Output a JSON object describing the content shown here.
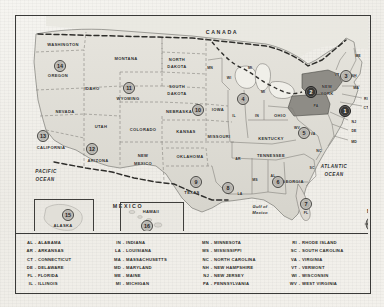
{
  "map": {
    "title": "United States numbered region map",
    "countries": [
      {
        "name": "CANADA",
        "x": 206,
        "y": 16,
        "cls": "big"
      },
      {
        "name": "MEXICO",
        "x": 112,
        "y": 190,
        "cls": "big"
      }
    ],
    "oceans": [
      {
        "name": "PACIFIC",
        "x": 30,
        "y": 155,
        "cls": "ocean"
      },
      {
        "name": "OCEAN",
        "x": 29,
        "y": 163,
        "cls": "ocean"
      },
      {
        "name": "ATLANTIC",
        "x": 318,
        "y": 150,
        "cls": "ocean"
      },
      {
        "name": "OCEAN",
        "x": 318,
        "y": 158,
        "cls": "ocean"
      },
      {
        "name": "Gulf of",
        "x": 244,
        "y": 190,
        "cls": "gulf"
      },
      {
        "name": "Mexico",
        "x": 244,
        "y": 196,
        "cls": "gulf"
      }
    ],
    "states": [
      {
        "name": "WASHINGTON",
        "x": 47,
        "y": 28,
        "cls": ""
      },
      {
        "name": "OREGON",
        "x": 42,
        "y": 59,
        "cls": ""
      },
      {
        "name": "IDAHO",
        "x": 76,
        "y": 72,
        "cls": ""
      },
      {
        "name": "MONTANA",
        "x": 110,
        "y": 42,
        "cls": ""
      },
      {
        "name": "NORTH",
        "x": 161,
        "y": 43,
        "cls": ""
      },
      {
        "name": "DAKOTA",
        "x": 161,
        "y": 50,
        "cls": ""
      },
      {
        "name": "SOUTH",
        "x": 161,
        "y": 70,
        "cls": ""
      },
      {
        "name": "DAKOTA",
        "x": 161,
        "y": 77,
        "cls": ""
      },
      {
        "name": "WYOMING",
        "x": 112,
        "y": 82,
        "cls": ""
      },
      {
        "name": "NEBRASKA",
        "x": 163,
        "y": 95,
        "cls": ""
      },
      {
        "name": "NEVADA",
        "x": 49,
        "y": 95,
        "cls": ""
      },
      {
        "name": "UTAH",
        "x": 85,
        "y": 110,
        "cls": ""
      },
      {
        "name": "COLORADO",
        "x": 127,
        "y": 113,
        "cls": ""
      },
      {
        "name": "KANSAS",
        "x": 170,
        "y": 115,
        "cls": ""
      },
      {
        "name": "IOWA",
        "x": 202,
        "y": 93,
        "cls": ""
      },
      {
        "name": "MISSOURI",
        "x": 203,
        "y": 120,
        "cls": ""
      },
      {
        "name": "CALIFORNIA",
        "x": 35,
        "y": 131,
        "cls": ""
      },
      {
        "name": "ARIZONA",
        "x": 82,
        "y": 144,
        "cls": ""
      },
      {
        "name": "NEW",
        "x": 127,
        "y": 139,
        "cls": ""
      },
      {
        "name": "MEXICO",
        "x": 127,
        "y": 147,
        "cls": ""
      },
      {
        "name": "OKLAHOMA",
        "x": 174,
        "y": 140,
        "cls": ""
      },
      {
        "name": "TEXAS",
        "x": 176,
        "y": 176,
        "cls": ""
      },
      {
        "name": "OHIO",
        "x": 264,
        "y": 99,
        "cls": ""
      },
      {
        "name": "KENTUCKY",
        "x": 255,
        "y": 122,
        "cls": ""
      },
      {
        "name": "TENNESSEE",
        "x": 255,
        "y": 139,
        "cls": ""
      },
      {
        "name": "GEORGIA",
        "x": 277,
        "y": 165,
        "cls": ""
      },
      {
        "name": "NEW",
        "x": 311,
        "y": 70,
        "cls": ""
      },
      {
        "name": "YORK",
        "x": 311,
        "y": 77,
        "cls": ""
      },
      {
        "name": "ALASKA",
        "x": 47,
        "y": 209,
        "cls": ""
      },
      {
        "name": "HAWAII",
        "x": 135,
        "y": 195,
        "cls": ""
      }
    ],
    "abbrevs": [
      {
        "name": "MN",
        "x": 194,
        "y": 52
      },
      {
        "name": "WI",
        "x": 213,
        "y": 62
      },
      {
        "name": "MI",
        "x": 234,
        "y": 52
      },
      {
        "name": "MI",
        "x": 247,
        "y": 76
      },
      {
        "name": "IL",
        "x": 218,
        "y": 100
      },
      {
        "name": "IN",
        "x": 241,
        "y": 100
      },
      {
        "name": "WV",
        "x": 281,
        "y": 112
      },
      {
        "name": "VA",
        "x": 297,
        "y": 118
      },
      {
        "name": "NC",
        "x": 303,
        "y": 135
      },
      {
        "name": "SC",
        "x": 296,
        "y": 152
      },
      {
        "name": "AL",
        "x": 257,
        "y": 160
      },
      {
        "name": "MS",
        "x": 239,
        "y": 164
      },
      {
        "name": "AR",
        "x": 222,
        "y": 143
      },
      {
        "name": "LA",
        "x": 224,
        "y": 178
      },
      {
        "name": "FL",
        "x": 290,
        "y": 197
      },
      {
        "name": "ME",
        "x": 342,
        "y": 40
      },
      {
        "name": "VT",
        "x": 321,
        "y": 59
      },
      {
        "name": "NH",
        "x": 338,
        "y": 60
      },
      {
        "name": "MA",
        "x": 340,
        "y": 72
      },
      {
        "name": "RI",
        "x": 350,
        "y": 83
      },
      {
        "name": "CT",
        "x": 350,
        "y": 92
      },
      {
        "name": "NJ",
        "x": 338,
        "y": 106
      },
      {
        "name": "DE",
        "x": 338,
        "y": 115
      },
      {
        "name": "MD",
        "x": 338,
        "y": 126
      },
      {
        "name": "PA",
        "x": 300,
        "y": 90
      }
    ],
    "markers": [
      {
        "num": "1",
        "x": 329,
        "y": 95,
        "dark": true
      },
      {
        "num": "2",
        "x": 295,
        "y": 76,
        "dark": true
      },
      {
        "num": "3",
        "x": 330,
        "y": 60,
        "dark": false
      },
      {
        "num": "4",
        "x": 227,
        "y": 83,
        "dark": false
      },
      {
        "num": "5",
        "x": 288,
        "y": 117,
        "dark": false
      },
      {
        "num": "6",
        "x": 262,
        "y": 166,
        "dark": false
      },
      {
        "num": "7",
        "x": 290,
        "y": 188,
        "dark": false
      },
      {
        "num": "8",
        "x": 212,
        "y": 172,
        "dark": false
      },
      {
        "num": "9",
        "x": 180,
        "y": 166,
        "dark": false
      },
      {
        "num": "10",
        "x": 182,
        "y": 94,
        "dark": false
      },
      {
        "num": "11",
        "x": 113,
        "y": 72,
        "dark": false
      },
      {
        "num": "12",
        "x": 76,
        "y": 133,
        "dark": false
      },
      {
        "num": "13",
        "x": 27,
        "y": 120,
        "dark": false
      },
      {
        "num": "14",
        "x": 44,
        "y": 50,
        "dark": false
      },
      {
        "num": "15",
        "x": 52,
        "y": 199,
        "dark": false
      },
      {
        "num": "16",
        "x": 131,
        "y": 210,
        "dark": false
      }
    ],
    "compass": {
      "north_label": "N"
    }
  },
  "legend": {
    "columns": [
      {
        "items": [
          {
            "abbr": "AL",
            "name": "ALABAMA"
          },
          {
            "abbr": "AR",
            "name": "ARKANSAS"
          },
          {
            "abbr": "CT",
            "name": "CONNECTICUT"
          },
          {
            "abbr": "DE",
            "name": "DELAWARE"
          },
          {
            "abbr": "FL",
            "name": "FLORIDA"
          },
          {
            "abbr": "IL",
            "name": "ILLINOIS"
          }
        ]
      },
      {
        "items": [
          {
            "abbr": "IN",
            "name": "INDIANA"
          },
          {
            "abbr": "LA",
            "name": "LOUISIANA"
          },
          {
            "abbr": "MA",
            "name": "MASSACHUSETTS"
          },
          {
            "abbr": "MD",
            "name": "MARYLAND"
          },
          {
            "abbr": "ME",
            "name": "MAINE"
          },
          {
            "abbr": "MI",
            "name": "MICHIGAN"
          }
        ]
      },
      {
        "items": [
          {
            "abbr": "MN",
            "name": "MINNESOTA"
          },
          {
            "abbr": "MS",
            "name": "MISSISSIPPI"
          },
          {
            "abbr": "NC",
            "name": "NORTH CAROLINA"
          },
          {
            "abbr": "NH",
            "name": "NEW HAMPSHIRE"
          },
          {
            "abbr": "NJ",
            "name": "NEW JERSEY"
          },
          {
            "abbr": "PA",
            "name": "PENNSYLVANIA"
          }
        ]
      },
      {
        "items": [
          {
            "abbr": "RI",
            "name": "RHODE ISLAND"
          },
          {
            "abbr": "SC",
            "name": "SOUTH CAROLINA"
          },
          {
            "abbr": "VA",
            "name": "VIRGINIA"
          },
          {
            "abbr": "VT",
            "name": "VERMONT"
          },
          {
            "abbr": "WI",
            "name": "WISCONSIN"
          },
          {
            "abbr": "WV",
            "name": "WEST VIRGINIA"
          }
        ]
      }
    ],
    "separator": "-"
  },
  "colors": {
    "land": "#dedcd5",
    "land_dark": "#8b8984",
    "border": "#3a3a38",
    "ink": "#2b2b29",
    "paper": "#f2f1ed"
  }
}
